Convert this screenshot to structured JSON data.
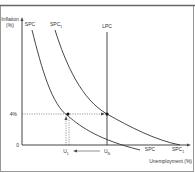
{
  "diagram": {
    "y_axis_label_line1": "Inflation",
    "y_axis_label_line2": "(%)",
    "x_axis_label": "Unemployment (%)",
    "origin_label": "0",
    "inflation_level_label": "4%",
    "curves": {
      "spc_top": "SPC",
      "spc1_top": "SPC",
      "spc1_sub": "1",
      "lpc": "LPC",
      "spc_bottom": "SPC",
      "spc1_bottom": "SPC",
      "spc1_bottom_sub": "1"
    },
    "x_ticks": {
      "u1": "U",
      "u1_sub": "1",
      "un": "U",
      "un_sub": "N"
    },
    "colors": {
      "line": "#333333",
      "frame": "#888888",
      "dotted": "#555555"
    }
  }
}
